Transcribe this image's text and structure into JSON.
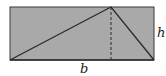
{
  "diagram": {
    "rectangle": {
      "x": 10,
      "y": 7,
      "width": 144,
      "height": 53,
      "fill": "#a9a9a9",
      "stroke": "#3a3a3a"
    },
    "triangle": {
      "apex_x": 111,
      "apex_y": 7,
      "left_x": 10,
      "right_x": 154,
      "base_y": 60,
      "stroke": "#2a2a2a"
    },
    "height_line": {
      "x": 111,
      "y1": 7,
      "y2": 60,
      "style": "dashed"
    },
    "labels": {
      "base": "b",
      "height": "h"
    }
  }
}
